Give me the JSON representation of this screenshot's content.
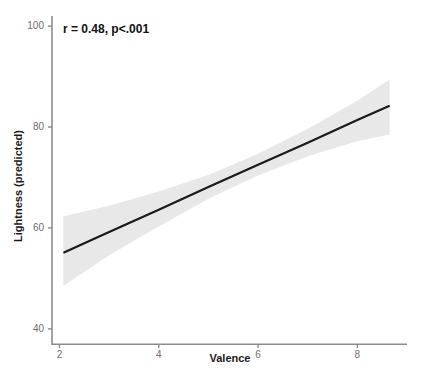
{
  "chart_data": {
    "type": "line",
    "title": "",
    "subtitle": "",
    "xlabel": "Valence",
    "ylabel": "Lightness (predicted)",
    "xlim": [
      1.85,
      9.0
    ],
    "ylim": [
      37,
      102
    ],
    "xticks": [
      2,
      4,
      6,
      8
    ],
    "xtick_labels": [
      "2",
      "4",
      "6",
      "8"
    ],
    "yticks": [
      40,
      60,
      80,
      100
    ],
    "ytick_labels": [
      "40",
      "60",
      "80",
      "100"
    ],
    "grid": false,
    "legend": "none",
    "annotations": [
      {
        "name": "correlation-annotation",
        "text": "r = 0.48, p<.001",
        "x": 2.1,
        "y": 99
      }
    ],
    "series": [
      {
        "name": "regression-line",
        "style": "solid",
        "color": "#1a1a1a",
        "x": [
          2.08,
          3.0,
          4.0,
          5.0,
          6.0,
          7.0,
          8.0,
          8.65
        ],
        "values": [
          55.1,
          59.2,
          63.6,
          68.1,
          72.5,
          76.9,
          81.4,
          84.2
        ]
      }
    ],
    "confidence_band": {
      "name": "confidence-interval-95",
      "color": "#e8e8e8",
      "x": [
        2.08,
        3.0,
        4.0,
        5.0,
        6.0,
        7.0,
        8.0,
        8.65
      ],
      "lower": [
        48.5,
        54.6,
        60.3,
        65.8,
        70.4,
        74.2,
        77.2,
        78.5
      ],
      "upper": [
        62.3,
        64.4,
        67.2,
        70.5,
        74.7,
        79.6,
        85.2,
        89.4
      ]
    }
  },
  "axis": {
    "x_title": "Valence",
    "y_title": "Lightness (predicted)"
  }
}
